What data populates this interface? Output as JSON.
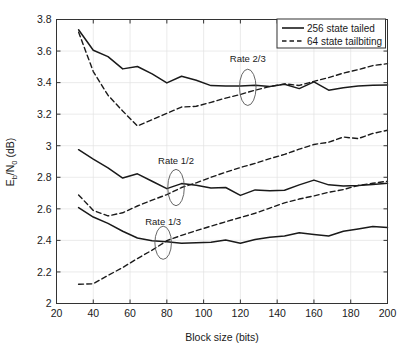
{
  "chart_data": {
    "type": "line",
    "title": "",
    "xlabel": "Block size (bits)",
    "ylabel": "E_b/N_0 (dB)",
    "ylabel_parts": {
      "main1": "E",
      "sub1": "b",
      "slash": "/N",
      "sub2": "0",
      "units": " (dB)"
    },
    "xlim": [
      20,
      200
    ],
    "ylim": [
      2,
      3.8
    ],
    "xticks": [
      20,
      40,
      60,
      80,
      100,
      120,
      140,
      160,
      180,
      200
    ],
    "yticks": [
      2,
      2.2,
      2.4,
      2.6,
      2.8,
      3,
      3.2,
      3.4,
      3.6,
      3.8
    ],
    "xtick_labels": [
      "20",
      "40",
      "60",
      "80",
      "100",
      "120",
      "140",
      "160",
      "180",
      "200"
    ],
    "ytick_labels": [
      "2",
      "2.2",
      "2.4",
      "2.6",
      "2.8",
      "3",
      "3.2",
      "3.4",
      "3.6",
      "3.8"
    ],
    "grid": true,
    "legend_position": "upper-right",
    "legend": [
      {
        "label": "256 state tailed",
        "style": "solid",
        "color": "#1a1a1a"
      },
      {
        "label": "64 state tailbiting",
        "style": "dashed",
        "color": "#1a1a1a"
      }
    ],
    "annotations": [
      {
        "text": "Rate 2/3",
        "x": 124,
        "y": 3.53,
        "ellipse_x": 124,
        "ellipse_y": 3.37,
        "ellipse_rx": 4.5,
        "ellipse_ry": 0.115
      },
      {
        "text": "Rate 1/2",
        "x": 85,
        "y": 2.885,
        "ellipse_x": 85,
        "ellipse_y": 2.735,
        "ellipse_rx": 4.5,
        "ellipse_ry": 0.115
      },
      {
        "text": "Rate 1/3",
        "x": 78,
        "y": 2.5,
        "ellipse_x": 78,
        "ellipse_y": 2.385,
        "ellipse_rx": 4.5,
        "ellipse_ry": 0.105
      }
    ],
    "series": [
      {
        "name": "Rate 2/3 - 256 state tailed",
        "group": "Rate 2/3",
        "style": "solid",
        "x": [
          32,
          40,
          48,
          56,
          64,
          72,
          80,
          88,
          96,
          104,
          112,
          120,
          128,
          136,
          144,
          152,
          160,
          168,
          176,
          184,
          192,
          200
        ],
        "y": [
          3.735,
          3.605,
          3.565,
          3.487,
          3.502,
          3.455,
          3.398,
          3.44,
          3.415,
          3.381,
          3.378,
          3.378,
          3.383,
          3.375,
          3.39,
          3.362,
          3.405,
          3.352,
          3.368,
          3.378,
          3.383,
          3.385
        ]
      },
      {
        "name": "Rate 2/3 - 64 state tailbiting",
        "group": "Rate 2/3",
        "style": "dashed",
        "x": [
          32,
          40,
          48,
          56,
          64,
          72,
          80,
          88,
          96,
          104,
          112,
          120,
          128,
          136,
          144,
          152,
          160,
          168,
          176,
          184,
          192,
          200
        ],
        "y": [
          3.72,
          3.47,
          3.32,
          3.22,
          3.125,
          3.165,
          3.205,
          3.245,
          3.25,
          3.275,
          3.302,
          3.325,
          3.352,
          3.375,
          3.392,
          3.382,
          3.408,
          3.432,
          3.46,
          3.482,
          3.508,
          3.52
        ]
      },
      {
        "name": "Rate 1/2 - 256 state tailed",
        "group": "Rate 1/2",
        "style": "solid",
        "x": [
          32,
          40,
          48,
          56,
          64,
          72,
          80,
          88,
          96,
          104,
          112,
          120,
          128,
          136,
          144,
          152,
          160,
          168,
          176,
          184,
          192,
          200
        ],
        "y": [
          2.975,
          2.915,
          2.86,
          2.795,
          2.822,
          2.775,
          2.728,
          2.76,
          2.75,
          2.732,
          2.735,
          2.685,
          2.72,
          2.715,
          2.718,
          2.752,
          2.782,
          2.752,
          2.745,
          2.748,
          2.755,
          2.762
        ]
      },
      {
        "name": "Rate 1/2 - 64 state tailbiting",
        "group": "Rate 1/2",
        "style": "dashed",
        "x": [
          32,
          40,
          48,
          56,
          64,
          72,
          80,
          88,
          96,
          104,
          112,
          120,
          128,
          136,
          144,
          152,
          160,
          168,
          176,
          184,
          192,
          200
        ],
        "y": [
          2.688,
          2.59,
          2.555,
          2.575,
          2.618,
          2.655,
          2.69,
          2.735,
          2.765,
          2.8,
          2.832,
          2.862,
          2.888,
          2.918,
          2.945,
          2.978,
          3.008,
          3.022,
          3.055,
          3.045,
          3.078,
          3.098
        ]
      },
      {
        "name": "Rate 1/3 - 256 state tailed",
        "group": "Rate 1/3",
        "style": "solid",
        "x": [
          32,
          40,
          48,
          56,
          64,
          72,
          80,
          88,
          96,
          104,
          112,
          120,
          128,
          136,
          144,
          152,
          160,
          168,
          176,
          184,
          192,
          200
        ],
        "y": [
          2.608,
          2.548,
          2.508,
          2.458,
          2.415,
          2.398,
          2.392,
          2.382,
          2.385,
          2.388,
          2.402,
          2.382,
          2.405,
          2.42,
          2.428,
          2.448,
          2.438,
          2.428,
          2.458,
          2.472,
          2.488,
          2.482
        ]
      },
      {
        "name": "Rate 1/3 - 64 state tailbiting",
        "group": "Rate 1/3",
        "style": "dashed",
        "x": [
          32,
          40,
          48,
          56,
          64,
          72,
          80,
          88,
          96,
          104,
          112,
          120,
          128,
          136,
          144,
          152,
          160,
          168,
          176,
          184,
          192,
          200
        ],
        "y": [
          2.122,
          2.125,
          2.178,
          2.228,
          2.285,
          2.338,
          2.398,
          2.432,
          2.462,
          2.49,
          2.518,
          2.545,
          2.572,
          2.605,
          2.638,
          2.662,
          2.682,
          2.705,
          2.722,
          2.748,
          2.762,
          2.775
        ]
      }
    ]
  }
}
